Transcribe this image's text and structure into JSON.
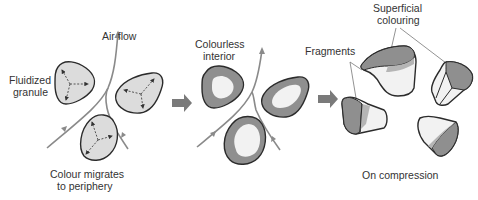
{
  "diagram": {
    "colors": {
      "granule_fill": "#dcdcdc",
      "coloured_shell": "#8f8f8f",
      "colourless_core": "#f2f2f2",
      "outline": "#2b2b2b",
      "air_flow": "#8a8a8a",
      "process_arrow": "#7a7a7a",
      "text": "#333333"
    },
    "stages": [
      {
        "id": "stage-1",
        "labels": {
          "air_flow": "Air flow",
          "granule_line1": "Fluidized",
          "granule_line2": "granule",
          "migration_line1": "Colour migrates",
          "migration_line2": "to periphery"
        }
      },
      {
        "id": "stage-2",
        "labels": {
          "interior_line1": "Colourless",
          "interior_line2": "interior"
        }
      },
      {
        "id": "stage-3",
        "labels": {
          "superficial_line1": "Superficial",
          "superficial_line2": "colouring",
          "fragments": "Fragments",
          "compression": "On compression"
        }
      }
    ],
    "arrows": [
      {
        "from": "stage-1",
        "to": "stage-2",
        "icon": "right-arrow-icon"
      },
      {
        "from": "stage-2",
        "to": "stage-3",
        "icon": "right-arrow-icon"
      }
    ]
  }
}
